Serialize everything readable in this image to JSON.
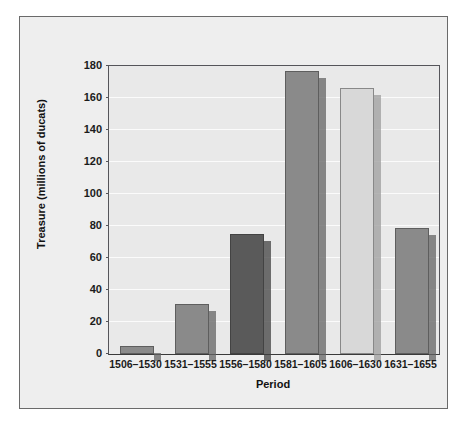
{
  "chart_data": {
    "type": "bar",
    "title": "",
    "xlabel": "Period",
    "ylabel": "Treasure (millions of ducats)",
    "categories": [
      "1506–1530",
      "1531–1555",
      "1556–1580",
      "1581–1605",
      "1606–1630",
      "1631–1655"
    ],
    "values": [
      5,
      31,
      75,
      177,
      166,
      79
    ],
    "ylim": [
      0,
      180
    ],
    "ytick_labels": [
      "0",
      "20",
      "40",
      "60",
      "80",
      "100",
      "120",
      "140",
      "160",
      "180"
    ],
    "ytick_values": [
      0,
      20,
      40,
      60,
      80,
      100,
      120,
      140,
      160,
      180
    ],
    "grid": true,
    "legend": "none",
    "bar_colors": [
      "#8a8a8a",
      "#8a8a8a",
      "#5a5a5a",
      "#8a8a8a",
      "#d8d8d8",
      "#8a8a8a"
    ],
    "style": "3d-shadowed-bars",
    "plot_background": "#e9e9e9",
    "panel_background": "#eeeeee",
    "gridline_color": "#fbfbfb",
    "axis_color": "#55555a",
    "text_color": "#1b1b1b"
  }
}
